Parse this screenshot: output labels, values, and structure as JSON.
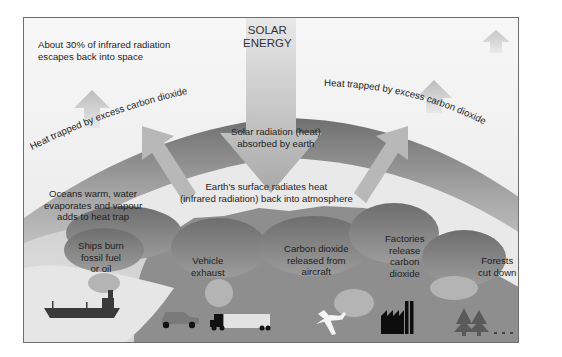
{
  "diagram": {
    "title": "SOLAR ENERGY",
    "title_lines": [
      "SOLAR",
      "ENERGY"
    ],
    "escape_note": {
      "lines": [
        "About 30% of infrared radiation",
        "escapes back into space"
      ]
    },
    "trapped_left": "Heat trapped by excess carbon dioxide",
    "trapped_right": "Heat trapped by excess carbon dioxide",
    "absorbed": {
      "lines": [
        "Solar radiation (heat)",
        "absorbed by earth"
      ]
    },
    "radiates": {
      "lines": [
        "Earth's surface radiates heat",
        "(infrared radiation) back into atmosphere"
      ]
    },
    "oceans": {
      "lines": [
        "Oceans warm, water",
        "evaporates and vapour",
        "adds to heat trap"
      ]
    },
    "sources": [
      {
        "id": "ships",
        "lines": [
          "Ships burn",
          "fossil fuel",
          "or oil"
        ],
        "icon": "ship-icon"
      },
      {
        "id": "vehicles",
        "lines": [
          "Vehicle",
          "exhaust"
        ],
        "icon": "car-truck-icon"
      },
      {
        "id": "aircraft",
        "lines": [
          "Carbon dioxide",
          "released from",
          "aircraft"
        ],
        "icon": "airplane-icon"
      },
      {
        "id": "factories",
        "lines": [
          "Factories",
          "release",
          "carbon",
          "dioxide"
        ],
        "icon": "factory-icon"
      },
      {
        "id": "forests",
        "lines": [
          "Forests",
          "cut down"
        ],
        "icon": "trees-icon"
      }
    ],
    "colors": {
      "sky": "#f4f4f4",
      "atmosphere_band": "#9a9a9a",
      "earth": "#8c8c8c",
      "clouds": "#7d7d7d",
      "ocean": "#e2e2e2",
      "arrow": "#b0b0b0",
      "icon_dark": "#2a2a2a",
      "text": "#1e1e1e"
    }
  }
}
